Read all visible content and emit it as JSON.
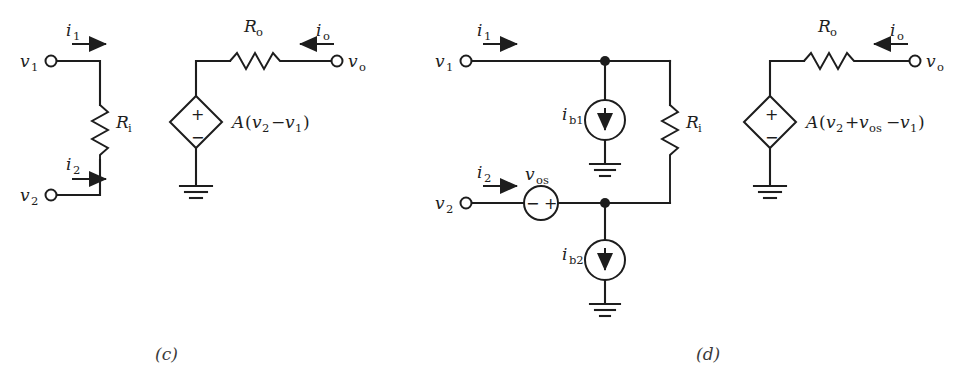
{
  "figure": {
    "background": "#ffffff",
    "ink_color": "#1d1d1d"
  },
  "captions": {
    "c": "(c)",
    "d": "(d)"
  },
  "circuit_c": {
    "name": "ideal-op-amp-model",
    "terminals": [
      {
        "id": "v1",
        "label": "v",
        "sub": "1"
      },
      {
        "id": "v2",
        "label": "v",
        "sub": "2"
      },
      {
        "id": "vo",
        "label": "v",
        "sub": "o"
      }
    ],
    "currents": [
      {
        "id": "i1",
        "label": "i",
        "sub": "1",
        "direction": "right"
      },
      {
        "id": "i2",
        "label": "i",
        "sub": "2",
        "direction": "right"
      },
      {
        "id": "io",
        "label": "i",
        "sub": "o",
        "direction": "left"
      }
    ],
    "components": [
      {
        "id": "Ri",
        "type": "resistor",
        "label": "R",
        "sub": "i",
        "orientation": "vertical"
      },
      {
        "id": "Ro",
        "type": "resistor",
        "label": "R",
        "sub": "o",
        "orientation": "horizontal"
      },
      {
        "id": "vcvs",
        "type": "dependent-voltage-source",
        "plus": "+",
        "minus": "−"
      },
      {
        "id": "gnd",
        "type": "ground"
      }
    ],
    "source_expression": {
      "gain": "A",
      "open": "(",
      "term1": "v",
      "term1_sub": "2",
      "operator": "−",
      "term2": "v",
      "term2_sub": "1",
      "close": ")"
    }
  },
  "circuit_d": {
    "name": "nonideal-op-amp-model-with-offsets",
    "terminals": [
      {
        "id": "v1",
        "label": "v",
        "sub": "1"
      },
      {
        "id": "v2",
        "label": "v",
        "sub": "2"
      },
      {
        "id": "vo",
        "label": "v",
        "sub": "o"
      }
    ],
    "currents": [
      {
        "id": "i1",
        "label": "i",
        "sub": "1",
        "direction": "right"
      },
      {
        "id": "i2",
        "label": "i",
        "sub": "2",
        "direction": "right"
      },
      {
        "id": "io",
        "label": "i",
        "sub": "o",
        "direction": "left"
      }
    ],
    "components": [
      {
        "id": "ib1",
        "type": "current-source",
        "label": "i",
        "sub": "b1",
        "direction": "down"
      },
      {
        "id": "ib2",
        "type": "current-source",
        "label": "i",
        "sub": "b2",
        "direction": "down"
      },
      {
        "id": "vos",
        "type": "voltage-source",
        "label": "v",
        "sub": "os",
        "minus": "−",
        "plus": "+"
      },
      {
        "id": "Ri",
        "type": "resistor",
        "label": "R",
        "sub": "i",
        "orientation": "vertical"
      },
      {
        "id": "Ro",
        "type": "resistor",
        "label": "R",
        "sub": "o",
        "orientation": "horizontal"
      },
      {
        "id": "vcvs",
        "type": "dependent-voltage-source",
        "plus": "+",
        "minus": "−"
      },
      {
        "id": "gnd1",
        "type": "ground"
      },
      {
        "id": "gnd2",
        "type": "ground"
      },
      {
        "id": "gnd3",
        "type": "ground"
      }
    ],
    "source_expression": {
      "gain": "A",
      "open": "(",
      "term1": "v",
      "term1_sub": "2",
      "operator1": "+",
      "term2": "v",
      "term2_sub": "os",
      "operator2": "−",
      "term3": "v",
      "term3_sub": "1",
      "close": ")"
    }
  }
}
